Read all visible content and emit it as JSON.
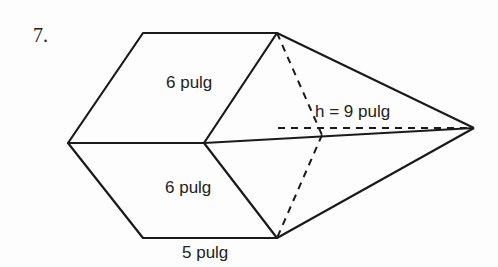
{
  "problem": {
    "number": "7.",
    "labels": {
      "top_edge": "6 pulg",
      "bottom_edge": "6 pulg",
      "base": "5 pulg",
      "height": "h = 9 pulg"
    }
  },
  "colors": {
    "stroke": "#1a1a1a",
    "background": "#fdfdfd"
  }
}
